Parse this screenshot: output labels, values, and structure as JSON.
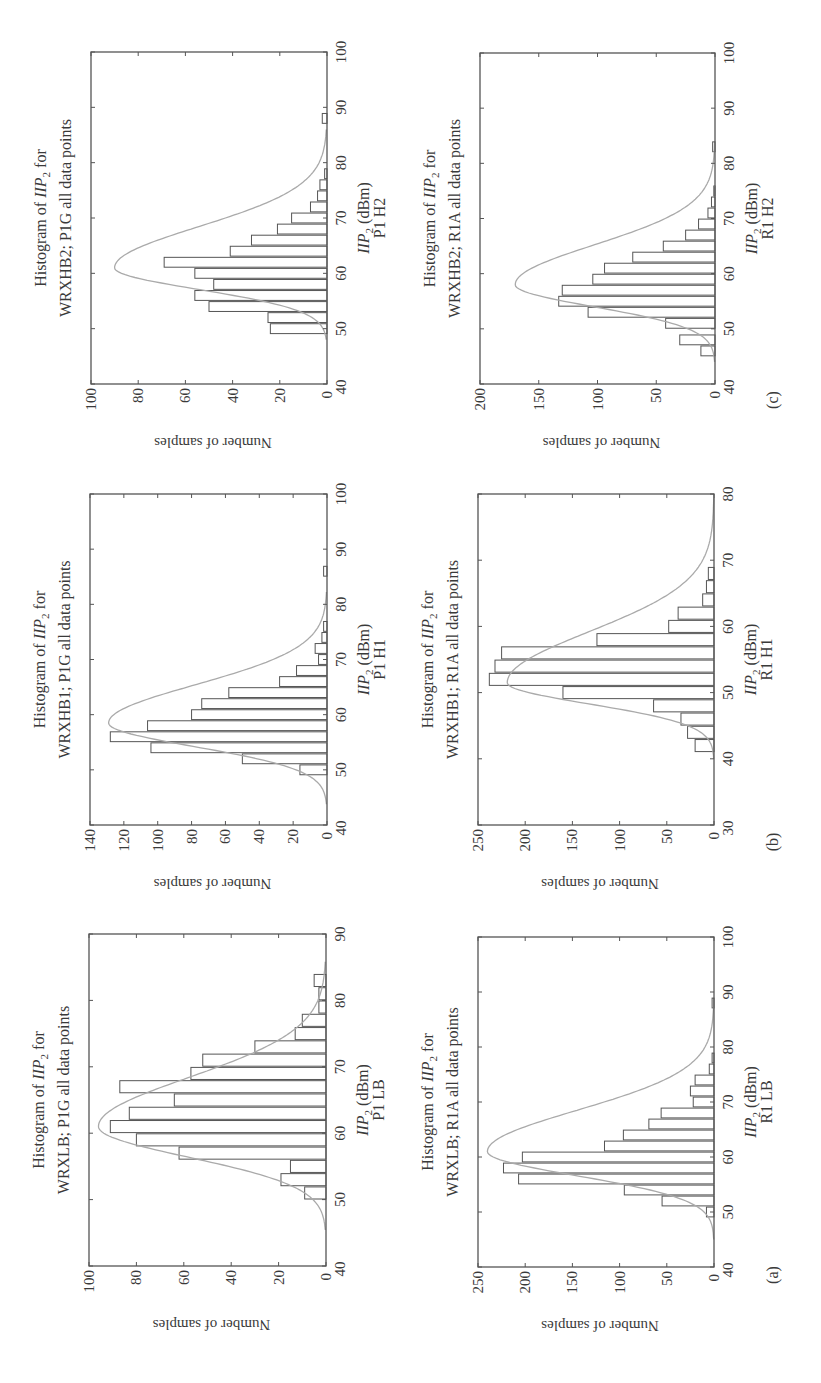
{
  "figure": {
    "orientation": "rotated-90-ccw",
    "colors": {
      "frame": "#555555",
      "bar_edge": "#555555",
      "bar_fill": "#ffffff",
      "fit_curve": "#aaaaaa",
      "text": "#3a3a3a"
    },
    "panel_labels": [
      "(a)",
      "(b)",
      "(c)"
    ],
    "ylabel": "Number of samples",
    "xlabel_main": "IIP",
    "xlabel_sub": "2",
    "xlabel_unit": " (dBm)"
  },
  "chart_data": [
    {
      "type": "bar",
      "id": "P1LB",
      "column": "(a)",
      "title_line1": "Histogram of IIP2 for",
      "title_line2": "WRXLB; P1G all data points",
      "xlabel": "IIP2 (dBm)",
      "xlabel_caption": "P1 LB",
      "ylabel": "Number of samples",
      "xlim": [
        40,
        90
      ],
      "ylim": [
        0,
        100
      ],
      "xticks": [
        40,
        50,
        60,
        70,
        80,
        90
      ],
      "yticks": [
        0,
        20,
        40,
        60,
        80,
        100
      ],
      "bin_width": 2,
      "x": [
        51,
        53,
        55,
        57,
        59,
        61,
        63,
        65,
        67,
        69,
        71,
        73,
        75,
        77,
        79,
        81,
        83
      ],
      "values": [
        9,
        19,
        15,
        62,
        80,
        91,
        83,
        64,
        87,
        57,
        52,
        30,
        13,
        10,
        3,
        3,
        5
      ],
      "fit": {
        "type": "gaussian",
        "mean": 61,
        "sigma": 4.6,
        "peak": 96,
        "tail_right": 1.6
      }
    },
    {
      "type": "bar",
      "id": "R1LB",
      "column": "(a)",
      "title_line1": "Histogram of IIP2 for",
      "title_line2": "WRXLB; R1A all data points",
      "xlabel": "IIP2 (dBm)",
      "xlabel_caption": "R1 LB",
      "ylabel": "Number of samples",
      "xlim": [
        40,
        100
      ],
      "ylim": [
        0,
        250
      ],
      "xticks": [
        40,
        50,
        60,
        70,
        80,
        90,
        100
      ],
      "yticks": [
        0,
        50,
        100,
        150,
        200,
        250
      ],
      "bin_width": 2,
      "x": [
        50,
        52,
        54,
        56,
        58,
        60,
        62,
        64,
        66,
        68,
        70,
        72,
        74,
        76,
        78,
        88
      ],
      "values": [
        8,
        55,
        95,
        207,
        223,
        203,
        116,
        96,
        69,
        56,
        22,
        25,
        20,
        5,
        2,
        2
      ],
      "fit": {
        "type": "gaussian",
        "mean": 61,
        "sigma": 4.4,
        "peak": 240,
        "tail_right": 1.7
      }
    },
    {
      "type": "bar",
      "id": "P1H1",
      "column": "(b)",
      "title_line1": "Histogram of IIP2 for",
      "title_line2": "WRXHB1; P1G all data points",
      "xlabel": "IIP2 (dBm)",
      "xlabel_caption": "P1 H1",
      "ylabel": "Number of samples",
      "xlim": [
        40,
        100
      ],
      "ylim": [
        0,
        140
      ],
      "xticks": [
        40,
        50,
        60,
        70,
        80,
        90,
        100
      ],
      "yticks": [
        0,
        20,
        40,
        60,
        80,
        100,
        120,
        140
      ],
      "bin_width": 2,
      "x": [
        50,
        52,
        54,
        56,
        58,
        60,
        62,
        64,
        66,
        68,
        70,
        72,
        74,
        76,
        86
      ],
      "values": [
        16,
        50,
        104,
        128,
        106,
        80,
        74,
        58,
        28,
        18,
        5,
        7,
        3,
        2,
        2
      ],
      "fit": {
        "type": "gaussian",
        "mean": 58.5,
        "sigma": 4.3,
        "peak": 129,
        "tail_right": 1.6
      }
    },
    {
      "type": "bar",
      "id": "R1H1",
      "column": "(b)",
      "title_line1": "Histogram of IIP2 for",
      "title_line2": "WRXHB1; R1A all data points",
      "xlabel": "IIP2 (dBm)",
      "xlabel_caption": "R1 H1",
      "ylabel": "Number of samples",
      "xlim": [
        30,
        80
      ],
      "ylim": [
        0,
        250
      ],
      "xticks": [
        30,
        40,
        50,
        60,
        70,
        80
      ],
      "yticks": [
        0,
        50,
        100,
        150,
        200,
        250
      ],
      "bin_width": 2,
      "x": [
        42,
        44,
        46,
        48,
        50,
        52,
        54,
        56,
        58,
        60,
        62,
        64,
        66,
        68
      ],
      "values": [
        20,
        28,
        35,
        64,
        160,
        238,
        232,
        225,
        124,
        48,
        38,
        12,
        8,
        6
      ],
      "fit": {
        "type": "gaussian",
        "mean": 51.5,
        "sigma": 3.2,
        "peak": 219,
        "tail_right": 2.4
      }
    },
    {
      "type": "bar",
      "id": "P1H2",
      "column": "(c)",
      "title_line1": "Histogram of IIP2 for",
      "title_line2": "WRXHB2; P1G all data points",
      "xlabel": "IIP2 (dBm)",
      "xlabel_caption": "P1 H2",
      "ylabel": "Number of samples",
      "xlim": [
        40,
        100
      ],
      "ylim": [
        0,
        100
      ],
      "xticks": [
        40,
        50,
        60,
        70,
        80,
        90,
        100
      ],
      "yticks": [
        0,
        20,
        40,
        60,
        80,
        100
      ],
      "bin_width": 2,
      "x": [
        50,
        52,
        54,
        56,
        58,
        60,
        62,
        64,
        66,
        68,
        70,
        72,
        74,
        76,
        78,
        88
      ],
      "values": [
        24,
        25,
        50,
        56,
        48,
        56,
        69,
        41,
        32,
        21,
        15,
        7,
        4,
        3,
        1,
        2
      ],
      "fit": {
        "type": "gaussian",
        "mean": 61,
        "sigma": 3.9,
        "peak": 90,
        "tail_right": 1.9
      }
    },
    {
      "type": "bar",
      "id": "R1H2",
      "column": "(c)",
      "title_line1": "Histogram of IIP2 for",
      "title_line2": "WRXHB2; R1A all data points",
      "xlabel": "IIP2 (dBm)",
      "xlabel_caption": "R1 H2",
      "ylabel": "Number of samples",
      "xlim": [
        40,
        100
      ],
      "ylim": [
        0,
        200
      ],
      "xticks": [
        40,
        50,
        60,
        70,
        80,
        90,
        100
      ],
      "yticks": [
        0,
        50,
        100,
        150,
        200
      ],
      "bin_width": 2,
      "x": [
        46,
        48,
        51,
        53,
        55,
        57,
        59,
        61,
        63,
        65,
        67,
        69,
        71,
        73,
        75,
        83
      ],
      "values": [
        12,
        30,
        42,
        108,
        133,
        130,
        104,
        94,
        70,
        44,
        25,
        14,
        6,
        3,
        1,
        2
      ],
      "fit": {
        "type": "gaussian",
        "mean": 58,
        "sigma": 4.0,
        "peak": 170,
        "tail_right": 1.8
      }
    }
  ],
  "layout_frames": {
    "P1H2": {
      "left": 91,
      "top": 52,
      "right": 327,
      "bottom": 384
    },
    "P1H1": {
      "left": 90,
      "top": 494,
      "right": 327,
      "bottom": 825
    },
    "P1LB": {
      "left": 89,
      "top": 934,
      "right": 326,
      "bottom": 1266
    },
    "R1H2": {
      "left": 480,
      "top": 53,
      "right": 715,
      "bottom": 384
    },
    "R1H1": {
      "left": 478,
      "top": 494,
      "right": 714,
      "bottom": 825
    },
    "R1LB": {
      "left": 478,
      "top": 937,
      "right": 714,
      "bottom": 1267
    }
  },
  "panel_label_positions": {
    "(a)": {
      "x": 778,
      "y": 1275
    },
    "(b)": {
      "x": 778,
      "y": 842
    },
    "(c)": {
      "x": 778,
      "y": 400
    }
  }
}
